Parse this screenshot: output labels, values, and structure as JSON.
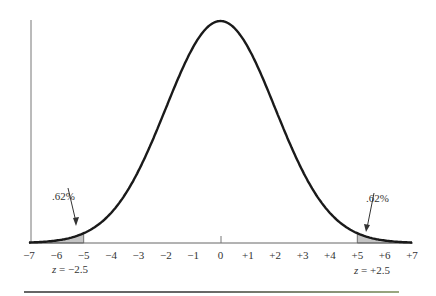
{
  "chart_data": {
    "type": "area",
    "title": "",
    "xlabel": "",
    "ylabel": "",
    "x_ticks": [
      "-7",
      "-6",
      "-5",
      "-4",
      "-3",
      "-2",
      "-1",
      "0",
      "+1",
      "+2",
      "+3",
      "+4",
      "+5",
      "+6",
      "+7"
    ],
    "xlim": [
      -7,
      7
    ],
    "mean": 0,
    "sd": 2,
    "shaded_regions": [
      {
        "from": -7,
        "to": -5,
        "label": ".62%",
        "z_label": "z = −2.5"
      },
      {
        "from": 5,
        "to": 7,
        "label": ".62%",
        "z_label": "z = +2.5"
      }
    ],
    "grid": false,
    "legend": "none"
  },
  "annotations": {
    "left_pct": ".62%",
    "right_pct": ".62%",
    "left_z_prefix": "z",
    "left_z_value": " = −2.5",
    "right_z_prefix": "z",
    "right_z_value": " = +2.5"
  },
  "colors": {
    "curve": "#1a1a1a",
    "shade": "#c4c4c4",
    "axis": "#555555"
  }
}
